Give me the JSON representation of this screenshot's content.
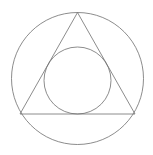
{
  "figure": {
    "canvas": {
      "width": 153,
      "height": 155,
      "background": "#ffffff"
    },
    "style": {
      "stroke_color": "#6e6e6e",
      "stroke_width": 0.8,
      "fill": "none"
    },
    "shapes": [
      {
        "name": "outer-circle",
        "type": "circle",
        "cx": 77.5,
        "cy": 78.5,
        "r": 66.0,
        "stroke": "#6e6e6e"
      },
      {
        "name": "inscribed-triangle",
        "type": "polygon",
        "points": "77.5,12.5 135.0,114.0 20.0,114.0",
        "vertices": [
          {
            "label": "apex",
            "x": 77.5,
            "y": 12.5
          },
          {
            "label": "bottom-right",
            "x": 135.0,
            "y": 114.0
          },
          {
            "label": "bottom-left",
            "x": 20.0,
            "y": 114.0
          }
        ],
        "stroke": "#6e6e6e"
      },
      {
        "name": "inner-circle",
        "type": "circle",
        "cx": 77.5,
        "cy": 80.5,
        "r": 33.5,
        "stroke": "#6e6e6e"
      }
    ]
  }
}
